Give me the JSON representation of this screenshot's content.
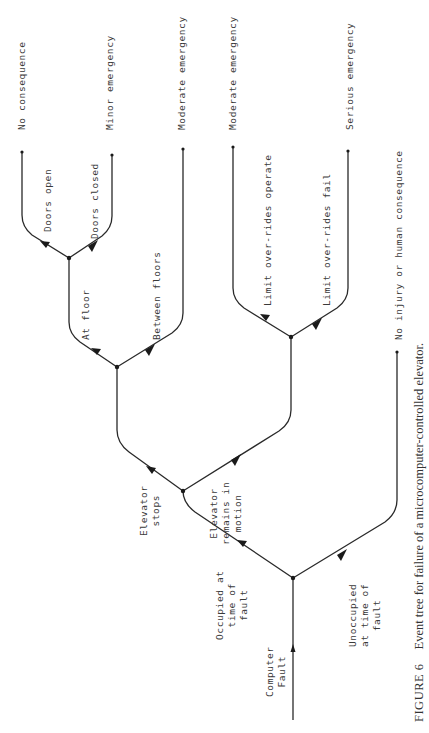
{
  "figure": {
    "number_label": "FIGURE 6",
    "caption": "Event tree for failure of a microcomputer-controlled elevator."
  },
  "initiating_event": {
    "label": "Computer\nFault"
  },
  "branches": {
    "occupied": "Occupied at\ntime of\nfault",
    "unoccupied": "Unoccupied\nat time of\nfault",
    "elevator_stops": "Elevator\nstops",
    "elevator_in_motion": "Elevator\nremains in\nmotion",
    "at_floor": "At floor",
    "between_floors": "Between floors",
    "doors_open": "Doors open",
    "doors_closed": "Doors closed",
    "limit_operate": "Limit over-rides operate",
    "limit_fail": "Limit over-rides fail"
  },
  "outcomes": [
    {
      "id": "no-consequence",
      "label": "No consequence"
    },
    {
      "id": "minor-emergency",
      "label": "Minor emergency"
    },
    {
      "id": "moderate-emergency-1",
      "label": "Moderate emergency"
    },
    {
      "id": "moderate-emergency-2",
      "label": "Moderate emergency"
    },
    {
      "id": "serious-emergency",
      "label": "Serious emergency"
    },
    {
      "id": "no-injury",
      "label": "No injury or human consequence"
    }
  ]
}
